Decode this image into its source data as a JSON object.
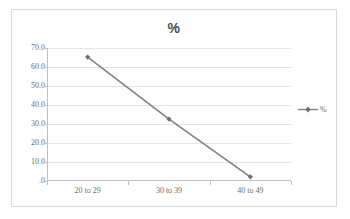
{
  "chart_data": {
    "type": "line",
    "title": "%",
    "xlabel": "",
    "ylabel": "",
    "categories": [
      "20 to 29",
      "30 to 39",
      "40 to 49"
    ],
    "series": [
      {
        "name": "%",
        "values": [
          65.2,
          32.6,
          2.2
        ]
      }
    ],
    "ylim": [
      0,
      70
    ],
    "ytick_labels": [
      "70.0",
      "60.0",
      "50.0",
      "40.0",
      "30.0",
      "20.0",
      "10.0",
      ".0"
    ],
    "ytick_values": [
      70,
      60,
      50,
      40,
      30,
      20,
      10,
      0
    ],
    "grid": true,
    "legend_position": "right",
    "legend_entries": [
      "%"
    ],
    "colors": {
      "series_line": "#808080",
      "marker": "#6f6f6f",
      "gridline": "#e4e4e4",
      "axis": "#bfbfbf",
      "tick_text": "#6b6b6b",
      "title_text": "#4a4a4a",
      "frame_border": "#d9d9d9",
      "plot_background": "#ffffff"
    }
  },
  "legend": {
    "label": "%"
  }
}
